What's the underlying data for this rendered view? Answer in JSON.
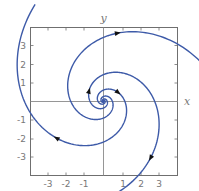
{
  "diagram": {
    "type": "phase-portrait",
    "axes": {
      "x_label": "x",
      "y_label": "y",
      "x_ticks": [
        "-3",
        "-2",
        "-1",
        "1",
        "2",
        "3"
      ],
      "y_ticks": [
        "3",
        "2",
        "1",
        "-1",
        "-2",
        "-3"
      ],
      "range": [
        -4,
        4
      ]
    },
    "colors": {
      "trajectory": "#3d5aa8",
      "axes": "#8a8a8a",
      "frame": "#6f6f6f",
      "text": "#777777"
    },
    "spiral": {
      "center_px": [
        103.5,
        101
      ],
      "a": 17,
      "b": 0.42,
      "theta0": 1.5708,
      "arms": [
        {
          "name": "arm-a",
          "rotation": 0,
          "start": -9.0,
          "end": 5.23,
          "arrows": [
            3.35,
            4.65
          ]
        },
        {
          "name": "arm-b",
          "rotation": 2.0944,
          "start": -9.0,
          "end": 5.23,
          "arrows": [
            0.1,
            3.5
          ]
        },
        {
          "name": "arm-c",
          "rotation": 4.1888,
          "start": -9.0,
          "end": 4.62,
          "arrows": [
            0.0,
            3.0
          ]
        }
      ]
    }
  }
}
